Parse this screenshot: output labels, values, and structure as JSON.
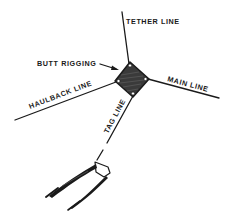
{
  "diagram": {
    "type": "rigging-diagram",
    "labels": {
      "tether_line": "TETHER LINE",
      "butt_rigging": "BUTT RIGGING",
      "main_line": "MAIN LINE",
      "haulback_line": "HAULBACK LINE",
      "tag_line": "TAG LINE"
    },
    "colors": {
      "ink": "#1a1a1a",
      "rigging_fill": "#3a3a3a",
      "background": "#ffffff"
    },
    "components": [
      {
        "id": "tether-line",
        "label": "TETHER LINE"
      },
      {
        "id": "butt-rigging",
        "label": "BUTT RIGGING"
      },
      {
        "id": "main-line",
        "label": "MAIN LINE"
      },
      {
        "id": "haulback-line",
        "label": "HAULBACK LINE"
      },
      {
        "id": "tag-line",
        "label": "TAG LINE"
      },
      {
        "id": "tongs",
        "label": ""
      }
    ]
  }
}
